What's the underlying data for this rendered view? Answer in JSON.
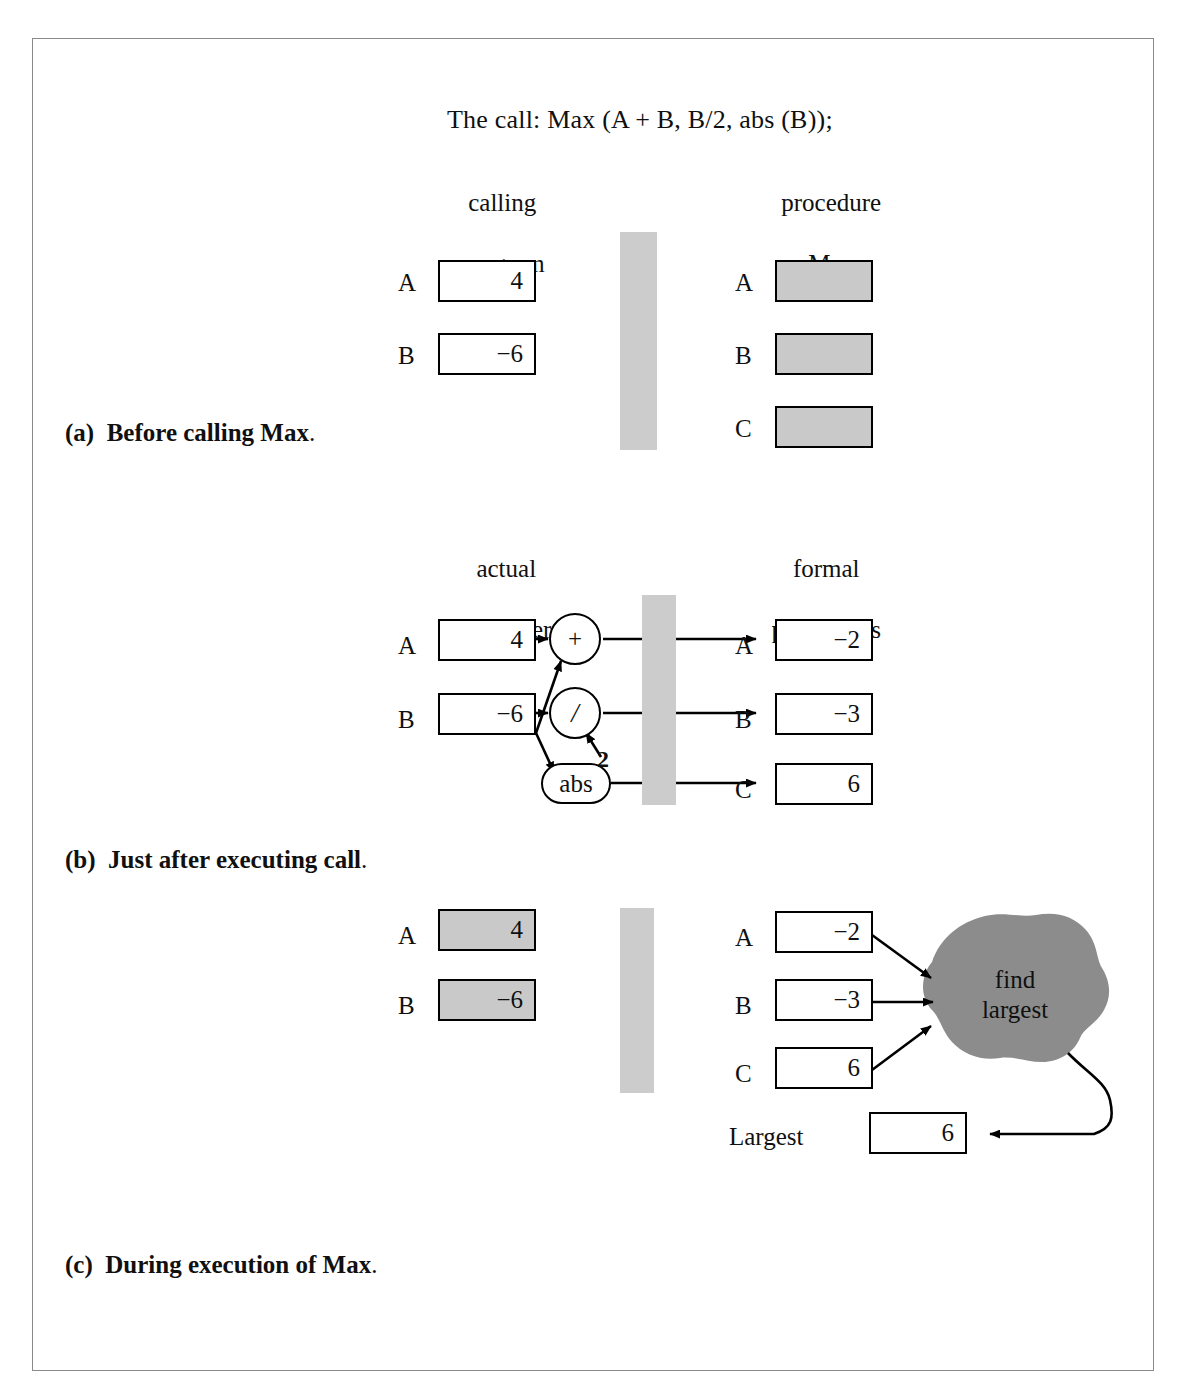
{
  "figure": {
    "call_line": "The call: Max (A + B, B/2, abs (B));",
    "colors": {
      "shaded_box_fill": "#c9c9c9",
      "divider_fill": "#cccccc",
      "blob_fill": "#8c8c8c",
      "stroke": "#000000",
      "frame_border": "#8a8a8a",
      "page_background": "#ffffff"
    }
  },
  "panel_a": {
    "caption_tag": "(a)",
    "caption_text": "Before calling Max",
    "caption_period": ".",
    "left_heading_line1": "calling",
    "left_heading_line2": "program",
    "right_heading_line1": "procedure",
    "right_heading_line2": "Max",
    "left_vars": [
      {
        "label": "A",
        "value": "4"
      },
      {
        "label": "B",
        "value": "−6"
      }
    ],
    "right_vars": [
      {
        "label": "A",
        "value": ""
      },
      {
        "label": "B",
        "value": ""
      },
      {
        "label": "C",
        "value": ""
      }
    ]
  },
  "panel_b": {
    "caption_tag": "(b)",
    "caption_text": "Just after executing call",
    "caption_period": ".",
    "left_heading_line1": "actual",
    "left_heading_line2": "parameters",
    "right_heading_line1": "formal",
    "right_heading_line2": "parameters",
    "left_vars": [
      {
        "label": "A",
        "value": "4"
      },
      {
        "label": "B",
        "value": "−6"
      }
    ],
    "right_vars": [
      {
        "label": "A",
        "value": "−2"
      },
      {
        "label": "B",
        "value": "−3"
      },
      {
        "label": "C",
        "value": "6"
      }
    ],
    "operators": [
      {
        "name": "plus",
        "symbol": "+"
      },
      {
        "name": "divide",
        "symbol": "/"
      },
      {
        "name": "abs",
        "symbol": "abs"
      }
    ],
    "constant_operand": "2"
  },
  "panel_c": {
    "caption_tag": "(c)",
    "caption_text": "During execution of Max",
    "caption_period": ".",
    "left_vars": [
      {
        "label": "A",
        "value": "4"
      },
      {
        "label": "B",
        "value": "−6"
      }
    ],
    "right_vars": [
      {
        "label": "A",
        "value": "−2"
      },
      {
        "label": "B",
        "value": "−3"
      },
      {
        "label": "C",
        "value": "6"
      }
    ],
    "process_line1": "find",
    "process_line2": "largest",
    "result_label": "Largest",
    "result_value": "6"
  }
}
